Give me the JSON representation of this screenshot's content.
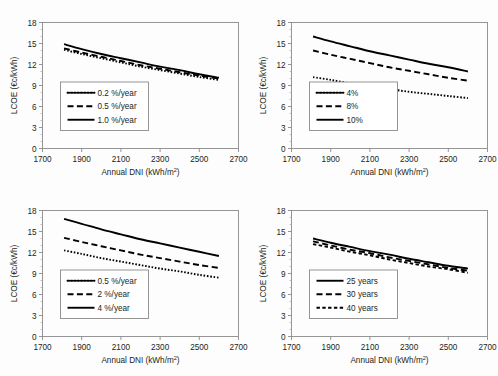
{
  "figure": {
    "name": "lcoe-vs-annual-dni-panels",
    "background_color": "#fdfdfd",
    "line_color": "#000000",
    "axis_color": "#8a8a8a",
    "panel_count": 4
  },
  "chart_data": [
    {
      "id": "panel-a",
      "position": "top-left",
      "type": "line",
      "title": "",
      "xlabel": "Annual DNI (kWh/m²)",
      "ylabel": "LCOE (€c/kWh)",
      "xlim": [
        1700,
        2700
      ],
      "ylim": [
        0,
        18
      ],
      "xticks": [
        1700,
        1900,
        2100,
        2300,
        2500,
        2700
      ],
      "yticks": [
        0,
        3,
        6,
        9,
        12,
        15,
        18
      ],
      "grid": false,
      "legend_position": "lower-left-inside",
      "x": [
        1810,
        1900,
        2000,
        2100,
        2200,
        2300,
        2400,
        2500,
        2600
      ],
      "series": [
        {
          "name": "0.2 %/year",
          "style": "dotted",
          "values": [
            14.1,
            13.5,
            12.9,
            12.3,
            11.7,
            11.2,
            10.7,
            10.2,
            9.8
          ]
        },
        {
          "name": "0.5 %/year",
          "style": "dashed",
          "values": [
            14.3,
            13.7,
            13.1,
            12.5,
            11.9,
            11.4,
            10.9,
            10.4,
            10.0
          ]
        },
        {
          "name": "1.0 %/year",
          "style": "solid",
          "values": [
            14.9,
            14.2,
            13.5,
            12.9,
            12.3,
            11.7,
            11.2,
            10.6,
            10.1
          ]
        }
      ]
    },
    {
      "id": "panel-b",
      "position": "top-right",
      "type": "line",
      "title": "",
      "xlabel": "Annual DNI (kWh/m²)",
      "ylabel": "LCOE (€c/kWh)",
      "xlim": [
        1700,
        2700
      ],
      "ylim": [
        0,
        18
      ],
      "xticks": [
        1700,
        1900,
        2100,
        2300,
        2500,
        2700
      ],
      "yticks": [
        0,
        3,
        6,
        9,
        12,
        15,
        18
      ],
      "grid": false,
      "legend_position": "lower-left-inside",
      "x": [
        1810,
        1900,
        2000,
        2100,
        2200,
        2300,
        2400,
        2500,
        2600
      ],
      "series": [
        {
          "name": "4%",
          "style": "dotted",
          "values": [
            10.2,
            9.8,
            9.3,
            8.9,
            8.5,
            8.1,
            7.8,
            7.5,
            7.2
          ]
        },
        {
          "name": "8%",
          "style": "dashed",
          "values": [
            14.0,
            13.4,
            12.8,
            12.2,
            11.6,
            11.1,
            10.6,
            10.1,
            9.7
          ]
        },
        {
          "name": "10%",
          "style": "solid",
          "values": [
            16.0,
            15.3,
            14.6,
            13.9,
            13.3,
            12.7,
            12.1,
            11.6,
            11.0
          ]
        }
      ]
    },
    {
      "id": "panel-c",
      "position": "bottom-left",
      "type": "line",
      "title": "",
      "xlabel": "Annual DNI (kWh/m²)",
      "ylabel": "LCOE (€c/kWh)",
      "xlim": [
        1700,
        2700
      ],
      "ylim": [
        0,
        18
      ],
      "xticks": [
        1700,
        1900,
        2100,
        2300,
        2500,
        2700
      ],
      "yticks": [
        0,
        3,
        6,
        9,
        12,
        15,
        18
      ],
      "grid": false,
      "legend_position": "lower-left-inside",
      "x": [
        1810,
        1900,
        2000,
        2100,
        2200,
        2300,
        2400,
        2500,
        2600
      ],
      "series": [
        {
          "name": "0.5 %/year",
          "style": "dotted",
          "values": [
            12.3,
            11.8,
            11.2,
            10.7,
            10.2,
            9.7,
            9.3,
            8.8,
            8.4
          ]
        },
        {
          "name": "2 %/year",
          "style": "dashed",
          "values": [
            14.1,
            13.5,
            12.9,
            12.3,
            11.7,
            11.2,
            10.7,
            10.2,
            9.8
          ]
        },
        {
          "name": "4 %/year",
          "style": "solid",
          "values": [
            16.8,
            16.1,
            15.3,
            14.6,
            13.9,
            13.3,
            12.7,
            12.1,
            11.5
          ]
        }
      ]
    },
    {
      "id": "panel-d",
      "position": "bottom-right",
      "type": "line",
      "title": "",
      "xlabel": "Annual DNI (kWh/m²)",
      "ylabel": "LCOE (€c/kWh)",
      "xlim": [
        1700,
        2700
      ],
      "ylim": [
        0,
        18
      ],
      "xticks": [
        1700,
        1900,
        2100,
        2300,
        2500,
        2700
      ],
      "yticks": [
        0,
        3,
        6,
        9,
        12,
        15,
        18
      ],
      "grid": false,
      "legend_position": "lower-left-inside",
      "x": [
        1810,
        1900,
        2000,
        2100,
        2200,
        2300,
        2400,
        2500,
        2600
      ],
      "series": [
        {
          "name": "25 years",
          "style": "solid",
          "values": [
            14.0,
            13.4,
            12.8,
            12.2,
            11.7,
            11.1,
            10.6,
            10.1,
            9.7
          ]
        },
        {
          "name": "30 years",
          "style": "dashed",
          "values": [
            13.6,
            13.0,
            12.4,
            11.9,
            11.3,
            10.8,
            10.3,
            9.8,
            9.4
          ]
        },
        {
          "name": "40 years",
          "style": "short-dashed",
          "values": [
            13.2,
            12.7,
            12.1,
            11.6,
            11.0,
            10.5,
            10.0,
            9.6,
            9.1
          ]
        }
      ]
    }
  ],
  "axis_text": {
    "xlabel_main": "Annual DNI (kWh/m",
    "xlabel_sup": "2",
    "xlabel_close": ")",
    "ylabel": "LCOE (€c/kWh)"
  }
}
